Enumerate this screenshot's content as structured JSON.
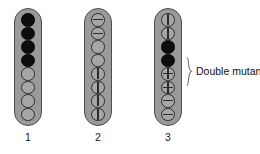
{
  "figure": {
    "type": "genetics-ascus-diagram",
    "background_color": "#ffffff",
    "ascus_fill_color": "#9a9a9a",
    "ascus_border_color": "#4d4d4d",
    "spore_filled_color": "#0d0d0d",
    "spore_open_color": "#a6a6a6",
    "spore_outline_color": "#2b2b2b"
  },
  "asci": [
    {
      "label": "1",
      "spores": [
        "filled",
        "filled",
        "filled",
        "filled",
        "open",
        "open",
        "open",
        "open"
      ]
    },
    {
      "label": "2",
      "spores": [
        "hbar",
        "hbar",
        "open",
        "open",
        "vbar",
        "vbar",
        "vbar",
        "vbar"
      ]
    },
    {
      "label": "3",
      "spores": [
        "vbar",
        "vbar",
        "filled",
        "filled",
        "cross",
        "cross",
        "hbar",
        "hbar"
      ]
    }
  ],
  "annotation": {
    "prefix": "Double mutants (",
    "genes": "b f",
    "suffix": ")",
    "full_text": "Double mutants (b f)",
    "brace_target_ascus": "3",
    "brace_target_spores": [
      5,
      6
    ]
  }
}
